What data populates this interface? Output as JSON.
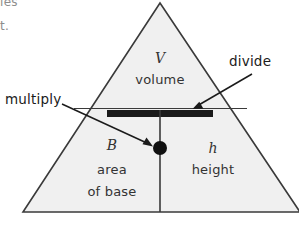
{
  "page": {
    "width": 299,
    "height": 227,
    "background": "#ffffff"
  },
  "colors": {
    "triangle_fill": "#f0f0f0",
    "triangle_stroke": "#3a3a3a",
    "divider_bar": "#1a1a1a",
    "dot": "#101010",
    "text": "#333333",
    "callout_text": "#1b1b1b",
    "cut_text": "#8d8d8d"
  },
  "page_margin_text": {
    "line1": "les",
    "line2": "t."
  },
  "triangle": {
    "apex": {
      "x": 160,
      "y": 3
    },
    "left": {
      "x": 23,
      "y": 212
    },
    "right": {
      "x": 300,
      "y": 212
    },
    "fill": "#f0f0f0",
    "stroke": "#3a3a3a",
    "stroke_width": 1.6
  },
  "separators": {
    "horizontal_thin_line": {
      "x1": 74,
      "y1": 108,
      "x2": 247,
      "y2": 108
    },
    "horizontal_bar": {
      "x": 107,
      "y": 110,
      "width": 106,
      "height": 7
    },
    "vertical_line": {
      "x": 160,
      "y1": 117,
      "y2": 212
    },
    "dot": {
      "cx": 160,
      "cy": 148,
      "r": 7
    }
  },
  "cells": {
    "top": {
      "symbol": "V",
      "label": "volume",
      "symbol_pos": {
        "x": 160,
        "y": 58
      },
      "label_pos": {
        "x": 160,
        "y": 80
      }
    },
    "bottom_left": {
      "symbol": "B",
      "label_line1": "area",
      "label_line2": "of base",
      "symbol_pos": {
        "x": 112,
        "y": 145
      },
      "label1_pos": {
        "x": 112,
        "y": 170
      },
      "label2_pos": {
        "x": 112,
        "y": 192
      }
    },
    "bottom_right": {
      "symbol": "h",
      "label": "height",
      "symbol_pos": {
        "x": 213,
        "y": 148
      },
      "label_pos": {
        "x": 213,
        "y": 170
      }
    }
  },
  "callouts": [
    {
      "id": "multiply",
      "label": "multiply",
      "label_pos": {
        "x": 5,
        "y": 93
      },
      "arrow": {
        "x1": 62,
        "y1": 104,
        "x2": 152,
        "y2": 146
      }
    },
    {
      "id": "divide",
      "label": "divide",
      "label_pos": {
        "x": 229,
        "y": 61
      },
      "arrow": {
        "x1": 250,
        "y1": 76,
        "x2": 193,
        "y2": 109
      }
    }
  ]
}
